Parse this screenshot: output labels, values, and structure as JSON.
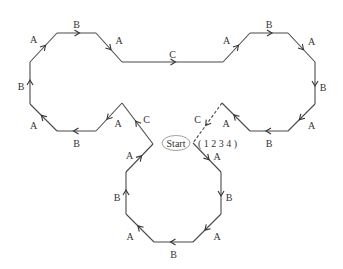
{
  "diagram": {
    "start_label": "Start",
    "permutation_label": "( 1 2 3 4 )",
    "edges": [
      {
        "id": "e1",
        "label": "A",
        "from": "L1",
        "to": "L2",
        "dashed": false
      },
      {
        "id": "e2",
        "label": "B",
        "from": "L2",
        "to": "L3",
        "dashed": false
      },
      {
        "id": "e3",
        "label": "A",
        "from": "L3",
        "to": "L4",
        "dashed": false
      },
      {
        "id": "e4",
        "label": "C",
        "from": "L4",
        "to": "R1",
        "dashed": false
      },
      {
        "id": "e5",
        "label": "A",
        "from": "R1",
        "to": "R2",
        "dashed": false
      },
      {
        "id": "e6",
        "label": "B",
        "from": "R2",
        "to": "R3",
        "dashed": false
      },
      {
        "id": "e7",
        "label": "A",
        "from": "R3",
        "to": "R4",
        "dashed": false
      },
      {
        "id": "e8",
        "label": "B",
        "from": "R4",
        "to": "R5",
        "dashed": false
      },
      {
        "id": "e9",
        "label": "A",
        "from": "R5",
        "to": "R6",
        "dashed": false
      },
      {
        "id": "e10",
        "label": "B",
        "from": "R6",
        "to": "R7",
        "dashed": false
      },
      {
        "id": "e11",
        "label": "A",
        "from": "R7",
        "to": "R8",
        "dashed": false
      },
      {
        "id": "e12",
        "label": "C",
        "from": "R8",
        "to": "S",
        "dashed": true
      },
      {
        "id": "e13",
        "label": "A",
        "from": "S",
        "to": "D1",
        "dashed": false
      },
      {
        "id": "e14",
        "label": "B",
        "from": "D1",
        "to": "D2",
        "dashed": false
      },
      {
        "id": "e15",
        "label": "A",
        "from": "D2",
        "to": "D3",
        "dashed": false
      },
      {
        "id": "e16",
        "label": "B",
        "from": "D3",
        "to": "D4",
        "dashed": false
      },
      {
        "id": "e17",
        "label": "A",
        "from": "D4",
        "to": "D5",
        "dashed": false
      },
      {
        "id": "e18",
        "label": "B",
        "from": "D5",
        "to": "D6",
        "dashed": false
      },
      {
        "id": "e19",
        "label": "A",
        "from": "D6",
        "to": "M1",
        "dashed": false
      },
      {
        "id": "e20",
        "label": "C",
        "from": "M1",
        "to": "M2",
        "dashed": false
      },
      {
        "id": "e21",
        "label": "A",
        "from": "M2",
        "to": "L7",
        "dashed": false
      },
      {
        "id": "e22",
        "label": "B",
        "from": "L7",
        "to": "L6",
        "dashed": false
      },
      {
        "id": "e23",
        "label": "A",
        "from": "L6",
        "to": "L5",
        "dashed": false
      },
      {
        "id": "e24",
        "label": "B",
        "from": "L5",
        "to": "L1",
        "dashed": false
      }
    ]
  }
}
